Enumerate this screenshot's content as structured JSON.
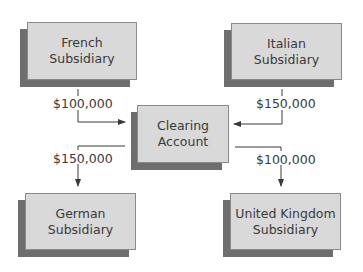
{
  "diagram": {
    "type": "flow",
    "nodes": [
      {
        "id": "french",
        "line1": "French",
        "line2": "Subsidiary"
      },
      {
        "id": "italian",
        "line1": "Italian",
        "line2": "Subsidiary"
      },
      {
        "id": "clearing",
        "line1": "Clearing",
        "line2": "Account"
      },
      {
        "id": "german",
        "line1": "German",
        "line2": "Subsidiary"
      },
      {
        "id": "uk",
        "line1": "United Kingdom",
        "line2": "Subsidiary"
      }
    ],
    "edges": [
      {
        "from": "french",
        "to": "clearing",
        "amount": "$100,000"
      },
      {
        "from": "italian",
        "to": "clearing",
        "amount": "$150,000"
      },
      {
        "from": "clearing",
        "to": "german",
        "amount": "$150,000"
      },
      {
        "from": "clearing",
        "to": "uk",
        "amount": "$100,000"
      }
    ]
  },
  "colors": {
    "box_fill": "#d9d9d9",
    "box_shadow": "#6e6e6e",
    "line": "#3a3a3a"
  }
}
